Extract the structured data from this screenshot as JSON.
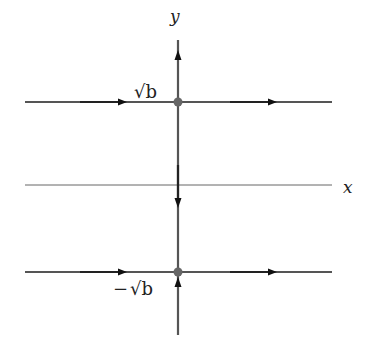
{
  "diagram": {
    "type": "phase-line / phase portrait",
    "axes": {
      "x_label": "x",
      "y_label": "y"
    },
    "equilibria": [
      {
        "label": "√b",
        "label_prefix": "",
        "position": "upper"
      },
      {
        "label": "√b",
        "label_prefix": "−",
        "position": "lower"
      }
    ],
    "flow": {
      "horizontal_lines": "right",
      "y_axis_above_upper": "up",
      "y_axis_between": "down",
      "y_axis_below_lower": "up"
    },
    "colors": {
      "line": "#555555",
      "axis": "#666666",
      "dot": "#666666",
      "arrow": "#111111",
      "text": "#222222"
    }
  }
}
